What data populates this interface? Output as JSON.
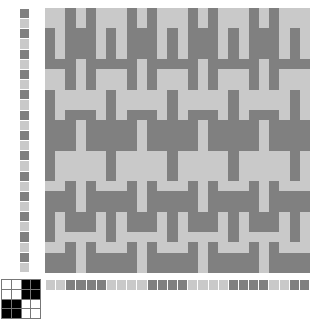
{
  "document": {
    "title": "Weaving Draft",
    "type": "weaving-draft",
    "background_color": "#ffffff"
  },
  "colors": {
    "warp_dark": "#808080",
    "warp_light": "#c9c9c9",
    "weft_dark": "#808080",
    "weft_light": "#c9c9c9",
    "cloth_light": "#c9c9c9",
    "cloth_dark": "#808080",
    "tieup_filled": "#000000",
    "tieup_empty": "#ffffff",
    "grid_line": "#ffffff"
  },
  "pattern_area": {
    "label": "woven-cloth-preview",
    "columns": 26,
    "rows": 26,
    "cell_px": 10,
    "weave_structure": "broken-twill-herringbone",
    "threading_repeat": [
      0,
      1,
      2,
      3,
      2,
      1
    ],
    "treadling_repeat": [
      0,
      1,
      2,
      3,
      2,
      1
    ],
    "grid": [
      "10011001100110011001100110",
      "11001100110011001100110011",
      "01100110011001100110011001",
      "00110011001100110011001100",
      "10011001100110011001100110",
      "11001100110011001100110011",
      "01100110011001100110011001",
      "00110011001100110011001100",
      "10011001100110011001100110",
      "11001100110011001100110011",
      "01100110011001100110011001",
      "00110011001100110011001100",
      "10011001100110011001100110",
      "11001100110011001100110011",
      "01100110011001100110011001",
      "00110011001100110011001100",
      "10011001100110011001100110",
      "11001100110011001100110011",
      "01100110011001100110011001",
      "00110011001100110011001100",
      "10011001100110011001100110",
      "11001100110011001100110011",
      "01100110011001100110011001",
      "00110011001100110011001100",
      "10011001100110011001100110",
      "11001100110011001100110011"
    ]
  },
  "warp_strip": {
    "label": "warp-color-order",
    "count": 26,
    "sequence": [
      "dark",
      "light",
      "dark",
      "light",
      "dark",
      "light",
      "dark",
      "light",
      "dark",
      "light",
      "dark",
      "light",
      "dark",
      "light",
      "dark",
      "light",
      "dark",
      "light",
      "dark",
      "light",
      "dark",
      "light",
      "dark",
      "light",
      "dark",
      "light"
    ]
  },
  "weft_strip": {
    "label": "weft-color-order",
    "count": 26,
    "sequence": [
      "light",
      "light",
      "dark",
      "dark",
      "dark",
      "dark",
      "light",
      "light",
      "light",
      "light",
      "dark",
      "dark",
      "dark",
      "dark",
      "light",
      "light",
      "light",
      "light",
      "dark",
      "dark",
      "dark",
      "dark",
      "light",
      "light",
      "dark",
      "dark"
    ]
  },
  "tieup": {
    "label": "tie-up-4x4",
    "rows": 4,
    "columns": 4,
    "grid": [
      [
        0,
        0,
        1,
        1
      ],
      [
        0,
        0,
        1,
        1
      ],
      [
        1,
        1,
        0,
        0
      ],
      [
        1,
        1,
        0,
        0
      ]
    ]
  }
}
